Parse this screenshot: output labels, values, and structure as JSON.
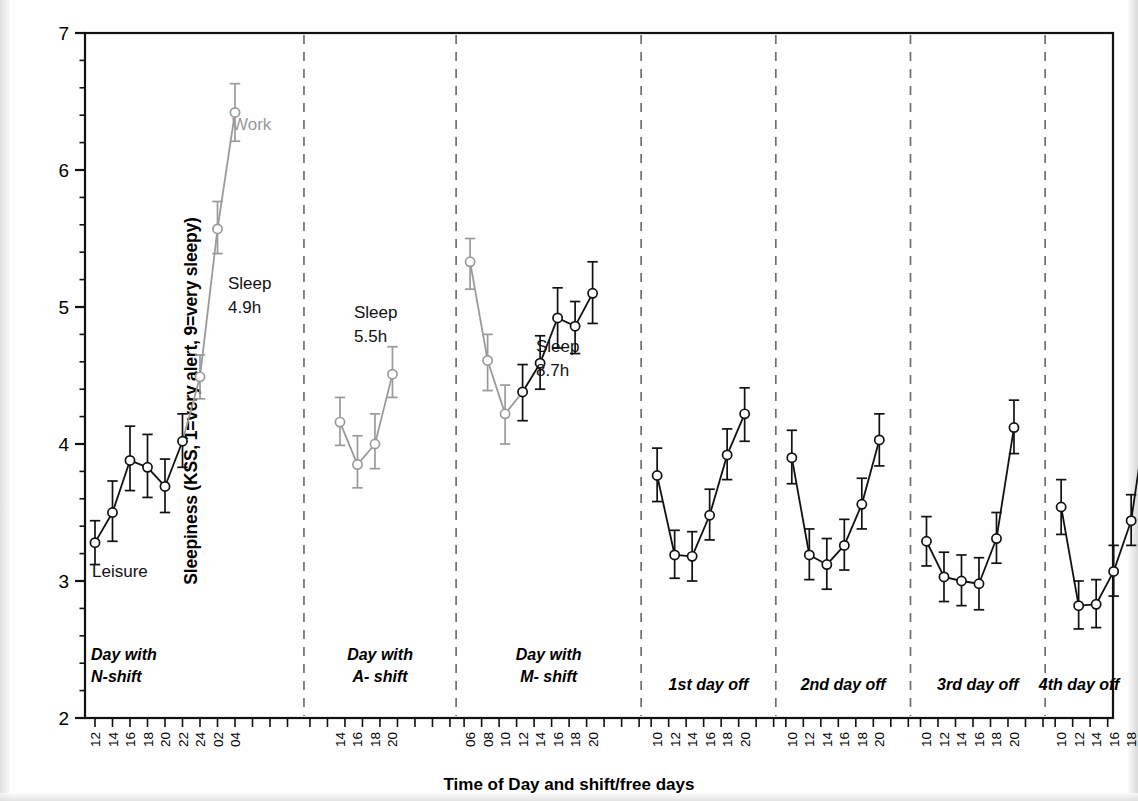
{
  "chart_data": {
    "type": "line",
    "title": "",
    "xlabel": "Time of Day and shift/free days",
    "ylabel": "Sleepiness (KSS, 1=very alert, 9=very sleepy)",
    "ylim": [
      2,
      7
    ],
    "yticks": [
      2,
      3,
      4,
      5,
      6,
      7
    ],
    "yticklabels": [
      "2",
      "3",
      "4",
      "5",
      "6",
      "7"
    ],
    "y_minor_step": 0.2,
    "grid": false,
    "legend": "none",
    "errorbars": "95% CI (whisker caps)",
    "colors": {
      "work": "#9a9a9a",
      "leisure": "#111111",
      "axis": "#111111",
      "divider": "#6f6f6f"
    },
    "panel_dividers": 7,
    "annotations": [
      {
        "text": "Work",
        "color": "#9a9a9a",
        "x_px": 232,
        "y_px": 130
      },
      {
        "text": "Leisure",
        "color": "#111111",
        "x_px": 92,
        "y_px": 577
      },
      {
        "text": "Sleep",
        "color": "#111111",
        "x_px": 228,
        "y_px": 289
      },
      {
        "text": "4.9h",
        "color": "#111111",
        "x_px": 228,
        "y_px": 313
      },
      {
        "text": "Sleep",
        "color": "#111111",
        "x_px": 354,
        "y_px": 318
      },
      {
        "text": "5.5h",
        "color": "#111111",
        "x_px": 354,
        "y_px": 342
      },
      {
        "text": "Sleep",
        "color": "#111111",
        "x_px": 536,
        "y_px": 352
      },
      {
        "text": "8.7h",
        "color": "#111111",
        "x_px": 536,
        "y_px": 376
      }
    ],
    "groups": [
      {
        "label": "Day with\nN-shift",
        "label_line1": "Day with",
        "label_line2": "N-shift",
        "label_align": "left",
        "x": [
          "12",
          "14",
          "16",
          "18",
          "20",
          "22",
          "24",
          "02",
          "04"
        ],
        "values": [
          3.28,
          3.5,
          3.88,
          3.83,
          3.69,
          4.02,
          4.49,
          5.57,
          6.42
        ],
        "err_low": [
          3.12,
          3.29,
          3.66,
          3.61,
          3.5,
          3.83,
          4.33,
          5.39,
          6.21
        ],
        "err_high": [
          3.44,
          3.73,
          4.13,
          4.07,
          3.89,
          4.22,
          4.65,
          5.77,
          6.63
        ],
        "segment_colors": [
          "leisure",
          "leisure",
          "leisure",
          "leisure",
          "leisure",
          "leisure",
          "work",
          "work",
          "work"
        ]
      },
      {
        "label_line1": "Day with",
        "label_line2": "A- shift",
        "label_align": "center",
        "x": [
          "14",
          "16",
          "18",
          "20"
        ],
        "values": [
          4.16,
          3.85,
          4.0,
          4.51
        ],
        "err_low": [
          3.99,
          3.68,
          3.82,
          4.34
        ],
        "err_high": [
          4.34,
          4.06,
          4.22,
          4.71
        ],
        "segment_colors": [
          "work",
          "work",
          "work",
          "work"
        ]
      },
      {
        "label_line1": "Day with",
        "label_line2": "M- shift",
        "label_align": "center",
        "x": [
          "06",
          "08",
          "10",
          "12",
          "14",
          "16",
          "18",
          "20"
        ],
        "values": [
          5.33,
          4.61,
          4.22,
          4.38,
          4.59,
          4.92,
          4.86,
          5.1
        ],
        "err_low": [
          5.13,
          4.39,
          4.0,
          4.17,
          4.4,
          4.7,
          4.66,
          4.88
        ],
        "err_high": [
          5.5,
          4.8,
          4.43,
          4.58,
          4.79,
          5.14,
          5.04,
          5.33
        ],
        "segment_colors": [
          "work",
          "work",
          "work",
          "leisure",
          "leisure",
          "leisure",
          "leisure",
          "leisure"
        ]
      },
      {
        "label_line1": "1st day off",
        "label_align": "center",
        "x": [
          "10",
          "12",
          "14",
          "16",
          "18",
          "20"
        ],
        "values": [
          3.77,
          3.19,
          3.18,
          3.48,
          3.92,
          4.22
        ],
        "err_low": [
          3.58,
          3.02,
          3.0,
          3.3,
          3.74,
          4.02
        ],
        "err_high": [
          3.97,
          3.37,
          3.36,
          3.67,
          4.11,
          4.41
        ],
        "segment_colors": [
          "leisure",
          "leisure",
          "leisure",
          "leisure",
          "leisure",
          "leisure"
        ]
      },
      {
        "label_line1": "2nd day off",
        "label_align": "center",
        "x": [
          "10",
          "12",
          "14",
          "16",
          "18",
          "20"
        ],
        "values": [
          3.9,
          3.19,
          3.12,
          3.26,
          3.56,
          4.03
        ],
        "err_low": [
          3.71,
          3.01,
          2.94,
          3.08,
          3.38,
          3.84
        ],
        "err_high": [
          4.1,
          3.38,
          3.31,
          3.45,
          3.75,
          4.22
        ],
        "segment_colors": [
          "leisure",
          "leisure",
          "leisure",
          "leisure",
          "leisure",
          "leisure"
        ]
      },
      {
        "label_line1": "3rd day off",
        "label_align": "center",
        "x": [
          "10",
          "12",
          "14",
          "16",
          "18",
          "20"
        ],
        "values": [
          3.29,
          3.03,
          3.0,
          2.98,
          3.31,
          4.12
        ],
        "err_low": [
          3.11,
          2.85,
          2.82,
          2.79,
          3.13,
          3.93
        ],
        "err_high": [
          3.47,
          3.21,
          3.19,
          3.17,
          3.5,
          4.32
        ],
        "segment_colors": [
          "leisure",
          "leisure",
          "leisure",
          "leisure",
          "leisure",
          "leisure"
        ]
      },
      {
        "label_line1": "4th day off",
        "label_align": "center",
        "x": [
          "10",
          "12",
          "14",
          "16",
          "18",
          "20"
        ],
        "values": [
          3.54,
          2.82,
          2.83,
          3.07,
          3.44,
          4.31
        ],
        "err_low": [
          3.34,
          2.65,
          2.66,
          2.89,
          3.26,
          4.11
        ],
        "err_high": [
          3.74,
          3.0,
          3.01,
          3.26,
          3.63,
          4.5
        ],
        "segment_colors": [
          "leisure",
          "leisure",
          "leisure",
          "leisure",
          "leisure",
          "leisure"
        ]
      }
    ]
  }
}
